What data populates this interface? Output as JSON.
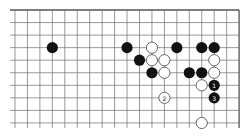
{
  "diagram": {
    "type": "go-board-fragment",
    "grid": {
      "columns": 19,
      "rows": 10,
      "origin_x": 15,
      "origin_y": 10,
      "spacing_x": 12.45,
      "spacing_y": 12.55,
      "edges": {
        "top": true,
        "right": true,
        "left": false,
        "bottom": false
      },
      "line_color": "#6e6e6e",
      "edge_color": "#555555"
    },
    "stone_radius": 5.6,
    "colors": {
      "black": "#111111",
      "white": "#ffffff",
      "white_outline": "#444444",
      "black_label": "#ffffff",
      "white_label": "#222222"
    },
    "stones": [
      {
        "color": "black",
        "col": 3,
        "row": 3
      },
      {
        "color": "black",
        "col": 9,
        "row": 3
      },
      {
        "color": "white",
        "col": 11,
        "row": 3
      },
      {
        "color": "black",
        "col": 13,
        "row": 3
      },
      {
        "color": "black",
        "col": 15,
        "row": 3
      },
      {
        "color": "black",
        "col": 16,
        "row": 3
      },
      {
        "color": "black",
        "col": 10,
        "row": 4
      },
      {
        "color": "white",
        "col": 11,
        "row": 4
      },
      {
        "color": "white",
        "col": 12,
        "row": 4
      },
      {
        "color": "white",
        "col": 16,
        "row": 4
      },
      {
        "color": "black",
        "col": 11,
        "row": 5
      },
      {
        "color": "white",
        "col": 12,
        "row": 5
      },
      {
        "color": "black",
        "col": 14,
        "row": 5
      },
      {
        "color": "black",
        "col": 15,
        "row": 5
      },
      {
        "color": "white",
        "col": 16,
        "row": 5
      },
      {
        "color": "white",
        "col": 15,
        "row": 6
      },
      {
        "color": "black",
        "col": 16,
        "row": 6,
        "label": "1"
      },
      {
        "color": "white",
        "col": 12,
        "row": 7,
        "label": "2"
      },
      {
        "color": "black",
        "col": 16,
        "row": 7,
        "label": "3"
      },
      {
        "color": "white",
        "col": 15,
        "row": 9
      }
    ]
  }
}
